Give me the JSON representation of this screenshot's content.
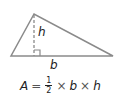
{
  "diagram": {
    "type": "triangle-area",
    "colors": {
      "stroke": "#8a8a8a",
      "text": "#222222"
    },
    "labels": {
      "height": "h",
      "base": "b"
    },
    "formula": {
      "lhs": "A",
      "equals": "=",
      "fraction_numerator": "1",
      "fraction_denominator": "2",
      "times_1": "×",
      "var_base": "b",
      "times_2": "×",
      "var_height": "h"
    }
  }
}
